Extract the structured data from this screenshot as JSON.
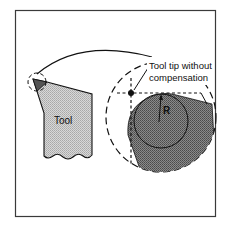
{
  "figure": {
    "type": "technical-illustration",
    "labels": {
      "tool": "Tool",
      "tip_line1": "Tool tip without",
      "tip_line2": "compensation",
      "radius": "R"
    },
    "colors": {
      "background": "#ffffff",
      "frame": "#3a3a3a",
      "tool_fill": "#c4c4c4",
      "tool_tip_fill": "#555555",
      "magnified_insert_fill": "#7a7a7a",
      "line": "#111111"
    }
  }
}
